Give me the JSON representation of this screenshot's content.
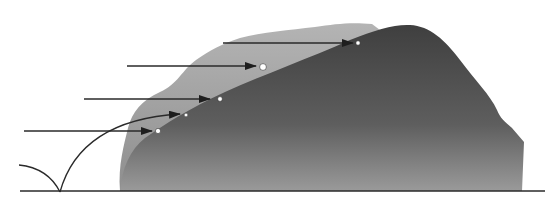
{
  "diagram": {
    "colors": {
      "background": "#ffffff",
      "halo": "#a9a9a9",
      "mound_top": "#4a4a4a",
      "mound_bottom": "#8c8c8c",
      "line": "#2a2a2a",
      "impact_point": "#ffffff"
    },
    "arrows": [
      {
        "id": "arrow-1",
        "x1": 24,
        "y1": 131,
        "x2": 152,
        "y2": 131,
        "impact": {
          "x": 158,
          "y": 131,
          "r": 2.6
        }
      },
      {
        "id": "arrow-2",
        "x1": 84,
        "y1": 99,
        "x2": 210,
        "y2": 99,
        "impact": {
          "x": 220,
          "y": 99,
          "r": 2.4
        }
      },
      {
        "id": "arrow-3",
        "x1": 127,
        "y1": 66,
        "x2": 256,
        "y2": 66,
        "impact": {
          "x": 263,
          "y": 67,
          "r": 3.4
        }
      },
      {
        "id": "arrow-4",
        "x1": 223,
        "y1": 43,
        "x2": 353,
        "y2": 43,
        "impact": {
          "x": 358,
          "y": 43,
          "r": 2.2
        }
      }
    ],
    "bounce_trajectory": {
      "incoming_arc": "M 19 165 Q 48 168 60 192",
      "outgoing_arc": "M 60 192 Q 80 120 180 114",
      "arrow_tip": {
        "x": 180,
        "y": 114
      },
      "impact": {
        "x": 186,
        "y": 115,
        "r": 1.8
      }
    },
    "ground_line": {
      "x1": 20,
      "y1": 191,
      "x2": 545,
      "y2": 191
    }
  }
}
